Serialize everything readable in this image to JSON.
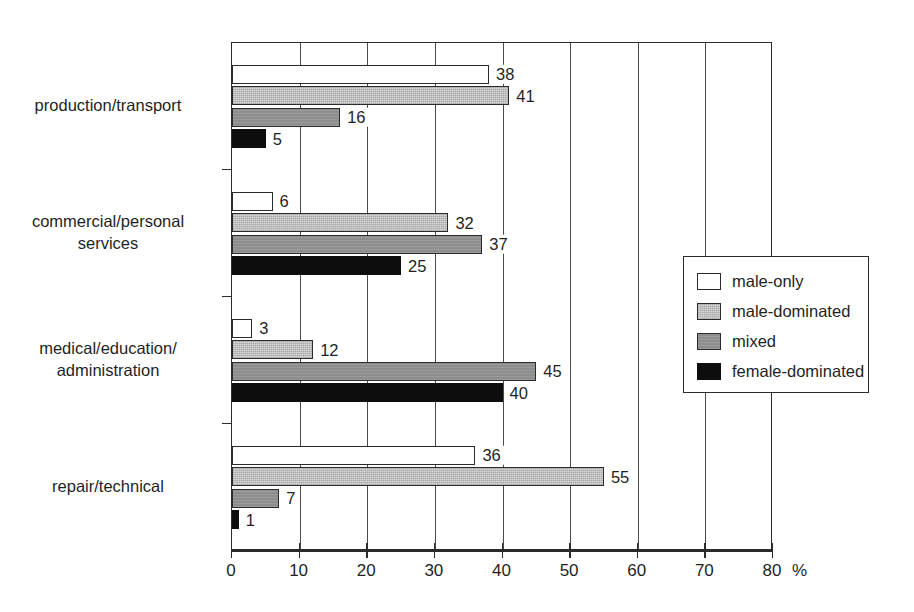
{
  "chart_data": {
    "type": "bar",
    "orientation": "horizontal",
    "title": "",
    "subtitle": "",
    "xlabel": "%",
    "ylabel": "",
    "xlim": [
      0,
      80
    ],
    "xticks": [
      0,
      10,
      20,
      30,
      40,
      50,
      60,
      70,
      80
    ],
    "xtick_labels": [
      "0",
      "10",
      "20",
      "30",
      "40",
      "50",
      "60",
      "70",
      "80"
    ],
    "grid": "vertical",
    "legend_position": "right-middle",
    "categories": [
      "production/transport",
      "commercial/personal\nservices",
      "medical/education/\nadministration",
      "repair/technical"
    ],
    "series": [
      {
        "name": "male-only",
        "color": "#ffffff",
        "values": [
          38,
          6,
          3,
          36
        ]
      },
      {
        "name": "male-dominated",
        "color": "#d8d8d8",
        "values": [
          41,
          32,
          12,
          55
        ]
      },
      {
        "name": "mixed",
        "color": "#8d8d8d",
        "values": [
          16,
          37,
          45,
          7
        ]
      },
      {
        "name": "female-dominated",
        "color": "#0d0d0d",
        "values": [
          5,
          25,
          40,
          1
        ]
      }
    ],
    "value_labels": [
      [
        "38",
        "41",
        "16",
        "5"
      ],
      [
        "6",
        "32",
        "37",
        "25"
      ],
      [
        "3",
        "12",
        "45",
        "40"
      ],
      [
        "36",
        "55",
        "7",
        "1"
      ]
    ]
  },
  "axis": {
    "unit_label": "%",
    "tick_labels": [
      "0",
      "10",
      "20",
      "30",
      "40",
      "50",
      "60",
      "70",
      "80"
    ]
  },
  "legend": {
    "items": [
      {
        "label": "male-only"
      },
      {
        "label": "male-dominated"
      },
      {
        "label": "mixed"
      },
      {
        "label": "female-dominated"
      }
    ]
  }
}
